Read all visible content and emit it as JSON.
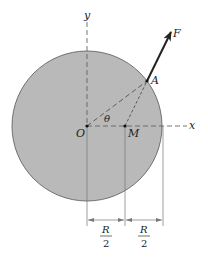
{
  "diagram": {
    "type": "mechanics-free-body",
    "disk": {
      "fill": "#b9b9b9",
      "stroke": "#555555"
    },
    "labels": {
      "y_axis": "y",
      "x_axis": "x",
      "origin": "O",
      "midpoint": "M",
      "point_a": "A",
      "force": "F",
      "angle": "θ"
    },
    "dimensions": [
      {
        "numerator": "R",
        "denominator": "2"
      },
      {
        "numerator": "R",
        "denominator": "2"
      }
    ]
  }
}
